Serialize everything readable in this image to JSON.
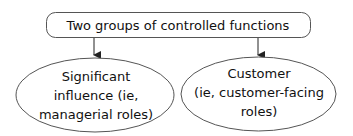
{
  "diagram": {
    "root": {
      "label": "Two groups of controlled functions"
    },
    "children": [
      {
        "lines": [
          "Significant",
          "influence (ie,",
          "managerial roles)"
        ]
      },
      {
        "lines": [
          "Customer",
          "(ie, customer-facing",
          "roles)"
        ]
      }
    ],
    "colors": {
      "stroke": "#555555",
      "text": "#111111",
      "background": "#ffffff"
    }
  }
}
